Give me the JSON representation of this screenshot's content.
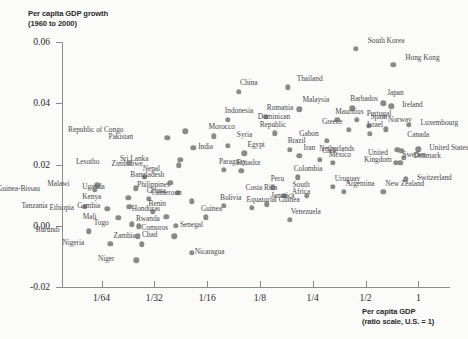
{
  "chart_data": {
    "type": "scatter",
    "title": "Per capita GDP growth",
    "subtitle": "(1960 to 2000)",
    "ylabel": "Per capita GDP growth (1960 to 2000)",
    "xlabel": "Per capita GDP (ratio scale, U.S. = 1)",
    "xlabel_line1": "Per capita GDP",
    "xlabel_line2": "(ratio scale, U.S. = 1)",
    "ytick_labels": [
      "0.06",
      "0.04",
      "0.02",
      "0.00",
      "-0.02"
    ],
    "ytick_values": [
      0.06,
      0.04,
      0.02,
      0.0,
      -0.02
    ],
    "xtick_labels": [
      "1/64",
      "1/32",
      "1/16",
      "1/8",
      "1/4",
      "1/2",
      "1"
    ],
    "xtick_values": [
      0.015625,
      0.03125,
      0.0625,
      0.125,
      0.25,
      0.5,
      1
    ],
    "ylim": [
      -0.02,
      0.06
    ],
    "xlim_log2": [
      -6.75,
      0.6
    ],
    "grid": false,
    "legend": false,
    "dot_color": "#8a8a8a",
    "axis_color": "#8d8d8d",
    "points": [
      {
        "name": "South Korea",
        "x": 0.44,
        "y": 0.0578,
        "lx": 12,
        "ly": -9
      },
      {
        "name": "Hong Kong",
        "x": 0.72,
        "y": 0.0525,
        "lx": 12,
        "ly": -8
      },
      {
        "name": "Thailand",
        "x": 0.18,
        "y": 0.0452,
        "lx": 9,
        "ly": -9
      },
      {
        "name": "Japan",
        "x": 0.63,
        "y": 0.04,
        "lx": 4,
        "ly": -11
      },
      {
        "name": "Ireland",
        "x": 0.7,
        "y": 0.039,
        "lx": 11,
        "ly": -2
      },
      {
        "name": "Barbados",
        "x": 0.42,
        "y": 0.0383,
        "lx": -2,
        "ly": -10
      },
      {
        "name": "Malaysia",
        "x": 0.21,
        "y": 0.038,
        "lx": 3,
        "ly": -10
      },
      {
        "name": "China",
        "x": 0.095,
        "y": 0.0437,
        "lx": 1,
        "ly": -10
      },
      {
        "name": "Portugal",
        "x": 0.445,
        "y": 0.0345,
        "lx": 10,
        "ly": -7
      },
      {
        "name": "Spain",
        "x": 0.52,
        "y": 0.0327,
        "lx": 2,
        "ly": -10
      },
      {
        "name": "Mauritius",
        "x": 0.345,
        "y": 0.0345,
        "lx": -2,
        "ly": -9
      },
      {
        "name": "Greece",
        "x": 0.4,
        "y": 0.0313,
        "lx": -6,
        "ly": -9
      },
      {
        "name": "Norway",
        "x": 0.655,
        "y": 0.0315,
        "lx": 2,
        "ly": -10
      },
      {
        "name": "Luxembourg",
        "x": 0.88,
        "y": 0.033,
        "lx": 12,
        "ly": -3
      },
      {
        "name": "Indonesia",
        "x": 0.082,
        "y": 0.0345,
        "lx": -3,
        "ly": -10
      },
      {
        "name": "Romania",
        "x": 0.135,
        "y": 0.0355,
        "lx": 1,
        "ly": -10
      },
      {
        "name": "Dominican Republic",
        "x": 0.152,
        "y": 0.0302,
        "lx": -2,
        "ly": -17
      },
      {
        "name": "Morocco",
        "x": 0.068,
        "y": 0.0292,
        "lx": -5,
        "ly": -10
      },
      {
        "name": "Syria",
        "x": 0.082,
        "y": 0.0262,
        "lx": 9,
        "ly": -12
      },
      {
        "name": "Israel",
        "x": 0.53,
        "y": 0.03,
        "lx": -3,
        "ly": -10
      },
      {
        "name": "Gabon",
        "x": 0.3,
        "y": 0.0278,
        "lx": -8,
        "ly": -8
      },
      {
        "name": "Canada",
        "x": 0.8,
        "y": 0.0245,
        "lx": 6,
        "ly": -17
      },
      {
        "name": "United States",
        "x": 1.0,
        "y": 0.025,
        "lx": 11,
        "ly": -2
      },
      {
        "name": "Netherlands",
        "x": 0.76,
        "y": 0.0248,
        "lx": -43,
        "ly": -2
      },
      {
        "name": "Denmark",
        "x": 0.825,
        "y": 0.0222,
        "lx": 10,
        "ly": -3
      },
      {
        "name": "Sweden",
        "x": 0.79,
        "y": 0.0205,
        "lx": 2,
        "ly": -9
      },
      {
        "name": "United Kingdom",
        "x": 0.745,
        "y": 0.0205,
        "lx": -18,
        "ly": -11
      },
      {
        "name": "Switzerland",
        "x": 0.85,
        "y": 0.0152,
        "lx": 11,
        "ly": -2
      },
      {
        "name": "Pakistan",
        "x": 0.037,
        "y": 0.0288,
        "lx": -34,
        "ly": -2
      },
      {
        "name": "Republic of Congo",
        "x": 0.047,
        "y": 0.0308,
        "lx": -62,
        "ly": -2
      },
      {
        "name": "India",
        "x": 0.052,
        "y": 0.0255,
        "lx": 5,
        "ly": -2
      },
      {
        "name": "Egypt",
        "x": 0.102,
        "y": 0.0237,
        "lx": 3,
        "ly": -9
      },
      {
        "name": "Brazil",
        "x": 0.185,
        "y": 0.0248,
        "lx": -2,
        "ly": -10
      },
      {
        "name": "Iran",
        "x": 0.21,
        "y": 0.0228,
        "lx": 4,
        "ly": -9
      },
      {
        "name": "Chile",
        "x": 0.275,
        "y": 0.0215,
        "lx": 2,
        "ly": -10
      },
      {
        "name": "Mexico",
        "x": 0.325,
        "y": 0.0205,
        "lx": -4,
        "ly": -9
      },
      {
        "name": "Sri Lanka",
        "x": 0.044,
        "y": 0.0215,
        "lx": -32,
        "ly": -2
      },
      {
        "name": "Zimbabwe",
        "x": 0.043,
        "y": 0.0197,
        "lx": -36,
        "ly": -2
      },
      {
        "name": "Paraguay",
        "x": 0.078,
        "y": 0.0182,
        "lx": -5,
        "ly": -9
      },
      {
        "name": "Ecuador",
        "x": 0.098,
        "y": 0.018,
        "lx": -5,
        "ly": -9
      },
      {
        "name": "Lesotho",
        "x": 0.0225,
        "y": 0.0205,
        "lx": -30,
        "ly": -2
      },
      {
        "name": "Nepal",
        "x": 0.0275,
        "y": 0.016,
        "lx": -2,
        "ly": -9
      },
      {
        "name": "Bangladesh",
        "x": 0.0385,
        "y": 0.014,
        "lx": -6,
        "ly": -9
      },
      {
        "name": "Colombia",
        "x": 0.205,
        "y": 0.0158,
        "lx": -4,
        "ly": -9
      },
      {
        "name": "Uruguay",
        "x": 0.325,
        "y": 0.0127,
        "lx": 2,
        "ly": -9
      },
      {
        "name": "Argentina",
        "x": 0.375,
        "y": 0.011,
        "lx": 2,
        "ly": -9
      },
      {
        "name": "New Zealand",
        "x": 0.63,
        "y": 0.011,
        "lx": 2,
        "ly": -9
      },
      {
        "name": "Peru",
        "x": 0.148,
        "y": 0.0125,
        "lx": -2,
        "ly": -9
      },
      {
        "name": "Costa Rica",
        "x": 0.172,
        "y": 0.0098,
        "lx": -7,
        "ly": -9
      },
      {
        "name": "South Africa",
        "x": 0.232,
        "y": 0.0098,
        "lx": -6,
        "ly": -12
      },
      {
        "name": "Jamaica",
        "x": 0.137,
        "y": 0.007,
        "lx": 4,
        "ly": -9
      },
      {
        "name": "Equatorial Guinea",
        "x": 0.112,
        "y": 0.0058,
        "lx": -5,
        "ly": -9
      },
      {
        "name": "Venezuela",
        "x": 0.185,
        "y": 0.002,
        "lx": 1,
        "ly": -9
      },
      {
        "name": "Malawi",
        "x": 0.0148,
        "y": 0.0132,
        "lx": -28,
        "ly": -2
      },
      {
        "name": "Uganda",
        "x": 0.0245,
        "y": 0.0122,
        "lx": -31,
        "ly": -2
      },
      {
        "name": "Guinea-Bissau",
        "x": 0.0143,
        "y": 0.0118,
        "lx": -55,
        "ly": -2
      },
      {
        "name": "Kenya",
        "x": 0.0222,
        "y": 0.0092,
        "lx": -27,
        "ly": -2
      },
      {
        "name": "Ghana",
        "x": 0.029,
        "y": 0.0088,
        "lx": -2,
        "ly": -9
      },
      {
        "name": "Philippines",
        "x": 0.0425,
        "y": 0.0108,
        "lx": -8,
        "ly": -9
      },
      {
        "name": "Cameroon",
        "x": 0.051,
        "y": 0.008,
        "lx": -10,
        "ly": -9
      },
      {
        "name": "Bolivia",
        "x": 0.078,
        "y": 0.0065,
        "lx": -4,
        "ly": -9
      },
      {
        "name": "Tanzania",
        "x": 0.0125,
        "y": 0.0062,
        "lx": -37,
        "ly": -2
      },
      {
        "name": "Ethiopia",
        "x": 0.0168,
        "y": 0.0055,
        "lx": -33,
        "ly": -2
      },
      {
        "name": "Gambia",
        "x": 0.0225,
        "y": 0.0062,
        "lx": -29,
        "ly": -2
      },
      {
        "name": "Benin",
        "x": 0.0305,
        "y": 0.0045,
        "lx": -4,
        "ly": -9
      },
      {
        "name": "Honduras",
        "x": 0.0365,
        "y": 0.003,
        "lx": -6,
        "ly": -9
      },
      {
        "name": "Guinea",
        "x": 0.0615,
        "y": 0.0028,
        "lx": -5,
        "ly": -9
      },
      {
        "name": "Mali",
        "x": 0.0195,
        "y": 0.0025,
        "lx": -22,
        "ly": -2
      },
      {
        "name": "Togo",
        "x": 0.0232,
        "y": 0.0005,
        "lx": -23,
        "ly": -2
      },
      {
        "name": "Rwanda",
        "x": 0.0255,
        "y": -0.0002,
        "lx": -3,
        "ly": -8
      },
      {
        "name": "Senegal",
        "x": 0.0415,
        "y": 0.0,
        "lx": 4,
        "ly": -2
      },
      {
        "name": "Burundi",
        "x": 0.0132,
        "y": -0.0018,
        "lx": -29,
        "ly": -2
      },
      {
        "name": "Chad",
        "x": 0.0252,
        "y": -0.0035,
        "lx": 4,
        "ly": -2
      },
      {
        "name": "Comoros",
        "x": 0.0405,
        "y": -0.0035,
        "lx": -6,
        "ly": -9
      },
      {
        "name": "Zambia",
        "x": 0.0265,
        "y": -0.006,
        "lx": -6,
        "ly": -9
      },
      {
        "name": "Nigeria",
        "x": 0.0175,
        "y": -0.0058,
        "lx": -26,
        "ly": -2
      },
      {
        "name": "Nicaragua",
        "x": 0.051,
        "y": -0.0088,
        "lx": 3,
        "ly": -2
      },
      {
        "name": "Niger",
        "x": 0.0247,
        "y": -0.0113,
        "lx": -22,
        "ly": -2
      }
    ]
  }
}
